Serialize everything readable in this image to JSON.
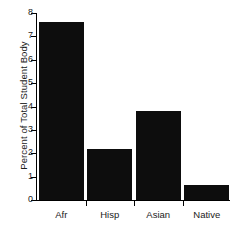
{
  "chart_data": {
    "type": "bar",
    "title": "",
    "xlabel": "",
    "ylabel": "Percent of Total Student Body",
    "categories": [
      "Afr",
      "Hisp",
      "Asian",
      "Native"
    ],
    "values": [
      7.6,
      2.2,
      3.8,
      0.65
    ],
    "ylim": [
      0,
      8
    ],
    "yticks": [
      0,
      1,
      2,
      3,
      4,
      5,
      6,
      7,
      8
    ],
    "ytick_labels": [
      "0",
      "1",
      "2",
      "3",
      "4",
      "5",
      "6",
      "7",
      "8"
    ],
    "grid": false,
    "legend": null,
    "bar_color": "#0d0d0d",
    "axis_color": "#000000",
    "background_color": "#ffffff"
  }
}
